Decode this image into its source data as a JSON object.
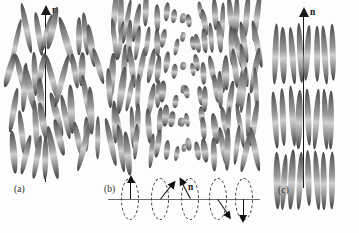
{
  "figure": {
    "kind": "scientific-diagram",
    "background_color": "#fdfdfd",
    "rod_color_dark": "#3f3f3f",
    "rod_color_light": "#cfcfcf",
    "ink_color": "#1b1b1b"
  },
  "panels": [
    {
      "key": "a",
      "label": "(a)",
      "phase": "nematic",
      "director_label": "n",
      "description": "rods aligned on average along the vertical director with no positional order"
    },
    {
      "key": "b",
      "label": "(b)",
      "phase": "cholesteric",
      "director_label": "n",
      "description": "director twists continuously about the horizontal axis; rods appear foreshortened at mid twist"
    },
    {
      "key": "c",
      "label": "(c)",
      "phase": "smectic-A",
      "director_label": "n",
      "description": "rods aligned along the director and organised into distinct layers"
    }
  ],
  "twist_diagram": {
    "name": "director-twist-sequence",
    "director_label": "n",
    "axis_label": "",
    "ellipse_count": 5,
    "arrow_angles_deg": [
      0,
      38,
      -28,
      145,
      180
    ],
    "description": "five dashed ellipses on a common horizontal axis, each containing a director arrow rotated progressively"
  }
}
